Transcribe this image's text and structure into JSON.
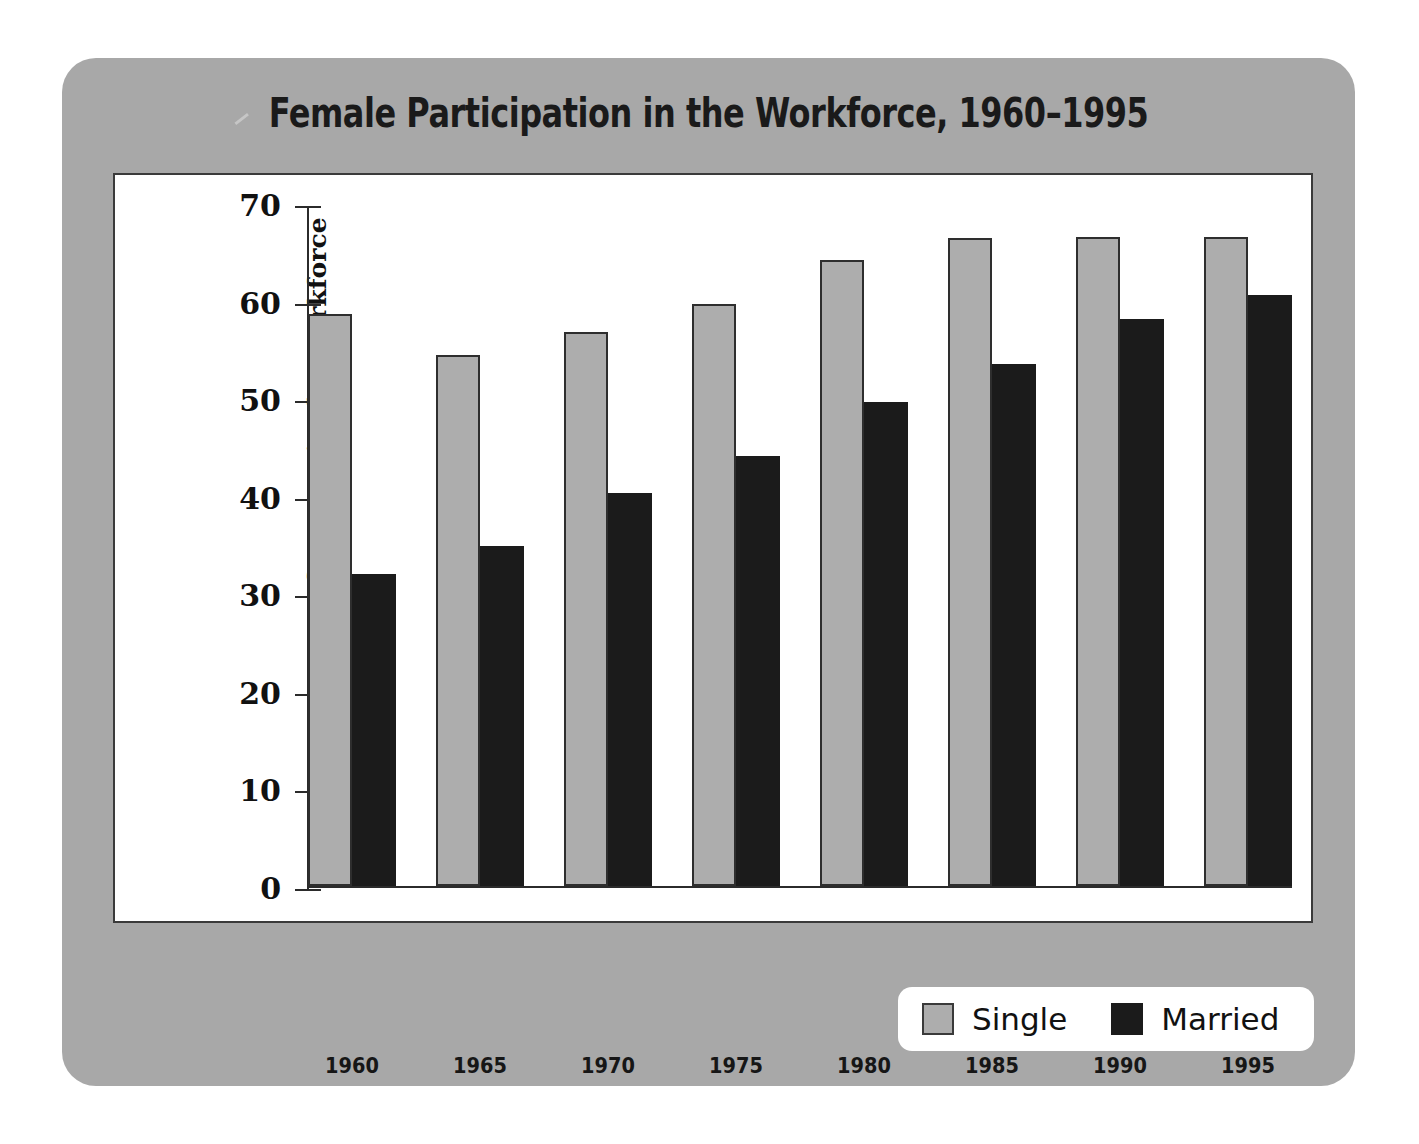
{
  "chart_data": {
    "type": "bar",
    "title": "Female Participation in the Workforce, 1960–1995",
    "xlabel": "",
    "ylabel": "Percentage of Women in the Workforce",
    "categories": [
      "1960",
      "1965",
      "1970",
      "1975",
      "1980",
      "1985",
      "1990",
      "1995"
    ],
    "series": [
      {
        "name": "Single",
        "color": "#adadad",
        "values": [
          58.6,
          54.4,
          56.8,
          59.7,
          64.2,
          66.4,
          66.5,
          66.5
        ]
      },
      {
        "name": "Married",
        "color": "#1b1b1b",
        "values": [
          32.0,
          34.8,
          40.3,
          44.1,
          49.6,
          53.5,
          58.1,
          60.6
        ]
      }
    ],
    "ylim": [
      0,
      70
    ],
    "yticks": [
      0,
      10,
      20,
      30,
      40,
      50,
      60,
      70
    ],
    "ytick_labels": [
      "0",
      "10",
      "20",
      "30",
      "40",
      "50",
      "60",
      "70"
    ],
    "grid": false,
    "legend_position": "bottom-right",
    "legend_entries": [
      "Single",
      "Married"
    ]
  },
  "figure": {
    "background_color": "#a8a8a8",
    "panel_color": "#ffffff",
    "axis_color": "#2b2b2b"
  }
}
